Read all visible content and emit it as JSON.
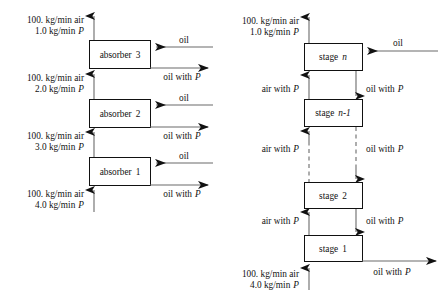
{
  "figure": {
    "stream_colors": {
      "line": "#6b6b6b",
      "box_border": "#111111",
      "arrowhead": "#111111",
      "background": "#ffffff"
    }
  },
  "left_diagram": {
    "name": "three-stage-absorber-cascade",
    "units": [
      {
        "id": "absorber-3",
        "label_prefix": "absorber",
        "label_number": "3"
      },
      {
        "id": "absorber-2",
        "label_prefix": "absorber",
        "label_number": "2"
      },
      {
        "id": "absorber-1",
        "label_prefix": "absorber",
        "label_number": "1"
      }
    ],
    "streams": {
      "top_gas_out_line1": "100. kg/min air",
      "top_gas_out_line2_amount": "1.0 kg/min",
      "top_gas_out_line2_species": "P",
      "gas_3_to_2_line1": "100. kg/min air",
      "gas_3_to_2_line2_amount": "2.0 kg/min",
      "gas_3_to_2_line2_species": "P",
      "gas_2_to_1_line1": "100. kg/min air",
      "gas_2_to_1_line2_amount": "3.0 kg/min",
      "gas_2_to_1_line2_species": "P",
      "bottom_gas_in_line1": "100. kg/min air",
      "bottom_gas_in_line2_amount": "4.0 kg/min",
      "bottom_gas_in_line2_species": "P",
      "oil_in": "oil",
      "oil_out_prefix": "oil with",
      "oil_out_species": "P"
    }
  },
  "right_diagram": {
    "name": "n-stage-countercurrent-cascade",
    "units": [
      {
        "id": "stage-n",
        "label_prefix": "stage",
        "label_number": "n"
      },
      {
        "id": "stage-n-minus-1",
        "label_prefix": "stage",
        "label_number": "n-1"
      },
      {
        "id": "stage-2",
        "label_prefix": "stage",
        "label_number": "2"
      },
      {
        "id": "stage-1",
        "label_prefix": "stage",
        "label_number": "1"
      }
    ],
    "streams": {
      "top_gas_out_line1": "100. kg/min air",
      "top_gas_out_line2_amount": "1.0 kg/min",
      "top_gas_out_line2_species": "P",
      "bottom_gas_in_line1": "100. kg/min air",
      "bottom_gas_in_line2_amount": "4.0 kg/min",
      "bottom_gas_in_line2_species": "P",
      "oil_in": "oil",
      "air_with_p_prefix": "air with",
      "air_with_p_species": "P",
      "oil_with_p_prefix": "oil with",
      "oil_with_p_species": "P"
    }
  }
}
